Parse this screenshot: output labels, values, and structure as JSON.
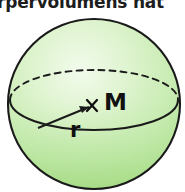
{
  "figure": {
    "kind": "sphere-diagram",
    "caption_partial": "rpervolumens hat",
    "labels": {
      "center": "M",
      "radius": "r"
    },
    "colors": {
      "fill_light": "#eaf7e3",
      "fill_mid": "#cdeeba",
      "fill_deep": "#a9dd85",
      "outline": "#1a1a1a",
      "background": "#ffffff",
      "text": "#111111"
    },
    "geometry": {
      "sphere_center_x": 94,
      "sphere_center_y": 104,
      "sphere_radius_x": 86,
      "sphere_radius_y": 85,
      "equator_rx": 84,
      "equator_ry": 30,
      "equator_cy": 100,
      "center_mark_x": 92,
      "center_mark_y": 106,
      "radius_start_x": 38,
      "radius_start_y": 128
    },
    "elements": {
      "outline_name": "sphere-outline",
      "equator_front_name": "equator-front-arc",
      "equator_back_name": "equator-back-arc-dashed",
      "radius_line_name": "radius-line",
      "center_mark_name": "center-cross-mark"
    }
  }
}
